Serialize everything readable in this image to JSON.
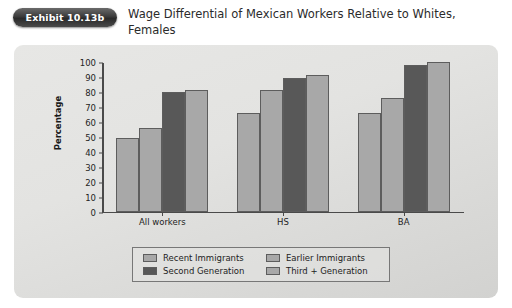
{
  "exhibit": {
    "badge": "Exhibit 10.13b"
  },
  "title": "Wage Differential of Mexican Workers Relative to Whites, Females",
  "colors": {
    "light_gray": "#a8a8a8",
    "dark_gray": "#585858",
    "panel_bg": "#e3e3e1",
    "axis": "#4a4a4a",
    "badge": "#3b3b3b"
  },
  "chart_data": {
    "type": "bar",
    "title": "Wage Differential of Mexican Workers Relative to Whites, Females",
    "xlabel": "",
    "ylabel": "Percentage",
    "ylim": [
      0,
      100
    ],
    "yticks": [
      0,
      10,
      20,
      30,
      40,
      50,
      60,
      70,
      80,
      90,
      100
    ],
    "grid": false,
    "legend_position": "bottom",
    "categories": [
      "All workers",
      "HS",
      "BA"
    ],
    "series": [
      {
        "name": "Recent Immigrants",
        "color": "#a8a8a8",
        "values": [
          49,
          66,
          66
        ]
      },
      {
        "name": "Earlier Immigrants",
        "color": "#a8a8a8",
        "values": [
          56,
          81,
          76
        ]
      },
      {
        "name": "Second Generation",
        "color": "#585858",
        "values": [
          80,
          89,
          98
        ]
      },
      {
        "name": "Third + Generation",
        "color": "#a8a8a8",
        "values": [
          81,
          91,
          100
        ]
      }
    ]
  }
}
